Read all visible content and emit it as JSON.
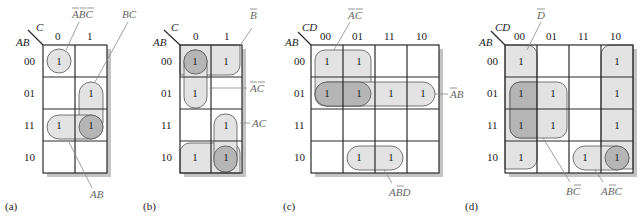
{
  "figure": {
    "maps": [
      {
        "id": "a",
        "caption": "(a)",
        "row_var": "AB",
        "col_var": "C",
        "col_labels": [
          "0",
          "1"
        ],
        "row_labels": [
          "00",
          "01",
          "11",
          "10"
        ],
        "cells": [
          [
            "1",
            ""
          ],
          [
            "",
            "1"
          ],
          [
            "1",
            "1"
          ],
          [
            "",
            ""
          ]
        ],
        "groups": [
          {
            "term": "A̅B̅C̅",
            "cells": "row 00, col 0"
          },
          {
            "term": "BC",
            "cells": "rows 01-11, col 1"
          },
          {
            "term": "AB",
            "cells": "row 11, cols 0-1"
          }
        ]
      },
      {
        "id": "b",
        "caption": "(b)",
        "row_var": "AB",
        "col_var": "C",
        "col_labels": [
          "0",
          "1"
        ],
        "row_labels": [
          "00",
          "01",
          "11",
          "10"
        ],
        "cells": [
          [
            "1",
            "1"
          ],
          [
            "1",
            ""
          ],
          [
            "",
            "1"
          ],
          [
            "1",
            "1"
          ]
        ],
        "groups": [
          {
            "term": "B̅",
            "cells": "rows 00 and 10 (wrap), cols 0-1"
          },
          {
            "term": "A̅C̅",
            "cells": "rows 00-01, col 0"
          },
          {
            "term": "AC",
            "cells": "rows 11-10, col 1"
          }
        ]
      },
      {
        "id": "c",
        "caption": "(c)",
        "row_var": "AB",
        "col_var": "CD",
        "col_labels": [
          "00",
          "01",
          "11",
          "10"
        ],
        "row_labels": [
          "00",
          "01",
          "11",
          "10"
        ],
        "cells": [
          [
            "1",
            "1",
            "",
            ""
          ],
          [
            "1",
            "1",
            "1",
            "1"
          ],
          [
            "",
            "",
            "",
            ""
          ],
          [
            "",
            "1",
            "1",
            ""
          ]
        ],
        "groups": [
          {
            "term": "A̅C̅",
            "cells": "rows 00-01, cols 00-01"
          },
          {
            "term": "A̅B",
            "cells": "row 01, all cols"
          },
          {
            "term": "AB̅D",
            "cells": "row 10, cols 01-11"
          }
        ]
      },
      {
        "id": "d",
        "caption": "(d)",
        "row_var": "AB",
        "col_var": "CD",
        "col_labels": [
          "00",
          "01",
          "11",
          "10"
        ],
        "row_labels": [
          "00",
          "01",
          "11",
          "10"
        ],
        "cells": [
          [
            "1",
            "",
            "",
            "1"
          ],
          [
            "1",
            "1",
            "",
            "1"
          ],
          [
            "1",
            "1",
            "",
            "1"
          ],
          [
            "1",
            "",
            "1",
            "1"
          ]
        ],
        "groups": [
          {
            "term": "D̅",
            "cells": "cols 00 and 10 (wrap), all rows"
          },
          {
            "term": "BC̅",
            "cells": "rows 01-11, cols 00-01"
          },
          {
            "term": "AB̅C",
            "cells": "row 10, cols 11-10"
          }
        ]
      }
    ],
    "labels": {
      "a_abc": "ABC",
      "a_bc": "BC",
      "a_ab": "AB",
      "b_b": "B",
      "b_ac_bar": "AC",
      "b_ac": "AC",
      "c_ac": "AC",
      "c_ab": "AB",
      "c_abd": "ABD",
      "d_d": "D",
      "d_bc": "BC",
      "d_abc": "ABC"
    },
    "colors": {
      "group_fill": "#e3e3e3",
      "overlap_fill": "#b5b5b5",
      "shadow": "#c4c4c4",
      "grid_line": "#2a2a2a",
      "annotation": "#777777"
    }
  }
}
